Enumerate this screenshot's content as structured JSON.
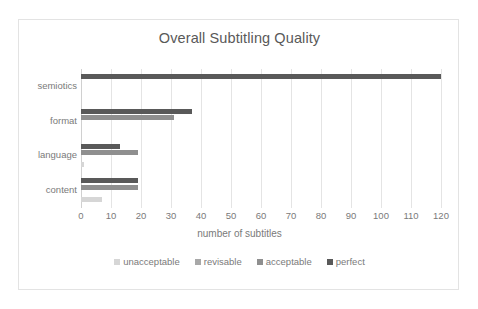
{
  "chart_data": {
    "type": "bar",
    "orientation": "horizontal",
    "title": "Overall Subtitling Quality",
    "xlabel": "number of subtitles",
    "ylabel": "",
    "xlim": [
      0,
      120
    ],
    "xticks": [
      0,
      10,
      20,
      30,
      40,
      50,
      60,
      70,
      80,
      90,
      100,
      110,
      120
    ],
    "grid": "vertical",
    "legend_position": "bottom",
    "categories": [
      "semiotics",
      "format",
      "language",
      "content"
    ],
    "series": [
      {
        "name": "unacceptable",
        "color": "#d6d6d6",
        "values": [
          0,
          0,
          1,
          7
        ]
      },
      {
        "name": "revisable",
        "color": "#a8a8a8",
        "values": [
          0,
          0,
          0,
          0
        ]
      },
      {
        "name": "acceptable",
        "color": "#8f8f8f",
        "values": [
          0,
          31,
          19,
          19
        ]
      },
      {
        "name": "perfect",
        "color": "#595959",
        "values": [
          120,
          37,
          13,
          19
        ]
      }
    ]
  },
  "legend": {
    "items": [
      {
        "label": "unacceptable",
        "color": "#d6d6d6"
      },
      {
        "label": "revisable",
        "color": "#a8a8a8"
      },
      {
        "label": "acceptable",
        "color": "#8f8f8f"
      },
      {
        "label": "perfect",
        "color": "#595959"
      }
    ]
  },
  "colors": {
    "frame_border": "#e3e3e3",
    "gridline": "#e4e4e4",
    "text": "#7a7a7a",
    "title_text": "#595959",
    "background": "#ffffff"
  }
}
